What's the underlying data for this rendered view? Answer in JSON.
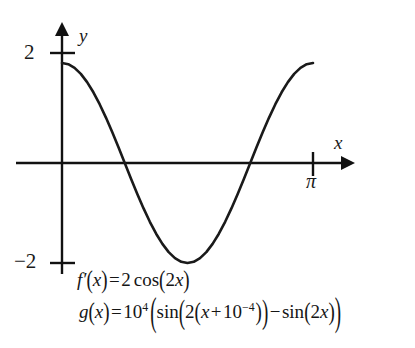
{
  "chart_data": {
    "type": "line",
    "title": "",
    "xlabel": "x",
    "ylabel": "y",
    "xlim": [
      0,
      3.141592653589793
    ],
    "ylim": [
      -2,
      2
    ],
    "grid": false,
    "legend": "none",
    "x_ticks": [
      {
        "value": 3.141592653589793,
        "label": "π"
      }
    ],
    "y_ticks": [
      {
        "value": 2,
        "label": "2"
      },
      {
        "value": -2,
        "label": "−2"
      }
    ],
    "series": [
      {
        "name": "f'(x) = 2cos(2x)",
        "x": [
          0.0,
          0.0785,
          0.1571,
          0.2356,
          0.3142,
          0.3927,
          0.4712,
          0.5498,
          0.6283,
          0.7069,
          0.7854,
          0.8639,
          0.9425,
          1.021,
          1.0996,
          1.1781,
          1.2566,
          1.3352,
          1.4137,
          1.4923,
          1.5708,
          1.6493,
          1.7279,
          1.8064,
          1.885,
          1.9635,
          2.042,
          2.1206,
          2.1991,
          2.2777,
          2.3562,
          2.4347,
          2.5133,
          2.5918,
          2.6704,
          2.7489,
          2.8274,
          2.906,
          2.9845,
          3.0631,
          3.1416
        ],
        "y": [
          2.0,
          1.9754,
          1.9021,
          1.782,
          1.618,
          1.4142,
          1.1756,
          0.908,
          0.618,
          0.3129,
          0.0,
          -0.3129,
          -0.618,
          -0.908,
          -1.1756,
          -1.4142,
          -1.618,
          -1.782,
          -1.9021,
          -1.9754,
          -2.0,
          -1.9754,
          -1.9021,
          -1.782,
          -1.618,
          -1.4142,
          -1.1756,
          -0.908,
          -0.618,
          -0.3129,
          0.0,
          0.3129,
          0.618,
          0.908,
          1.1756,
          1.4142,
          1.618,
          1.782,
          1.9021,
          1.9754,
          2.0
        ]
      }
    ],
    "annotations": [
      "f'(x) = 2cos(2x)",
      "g(x) = 10^4 ( sin(2(x + 10^-4)) - sin(2x) )"
    ]
  },
  "axes": {
    "y_label": "y",
    "x_label": "x",
    "y_tick_top": "2",
    "y_tick_bottom": "−2",
    "x_tick_pi": "π"
  },
  "formulas": {
    "fprime": {
      "fn": "f",
      "prime": "′",
      "open": "(",
      "arg": "x",
      "close": ")",
      "equals": "=",
      "coeff": "2",
      "trig": "cos",
      "inner_open": "(",
      "inner_coeff": "2",
      "inner_var": "x",
      "inner_close": ")"
    },
    "g": {
      "fn": "g",
      "open": "(",
      "arg": "x",
      "close": ")",
      "equals": "=",
      "base": "10",
      "exp": "4",
      "big_open": "(",
      "trig1": "sin",
      "p1_open": "(",
      "two_a": "2",
      "p2_open": "(",
      "var_a": "x",
      "plus": "+",
      "eps_base": "10",
      "eps_exp": "−4",
      "p2_close": ")",
      "p1_close": ")",
      "minus": "−",
      "trig2": "sin",
      "p3_open": "(",
      "two_b": "2",
      "var_b": "x",
      "p3_close": ")",
      "big_close": ")"
    }
  },
  "colors": {
    "curve": "#1a1a1a",
    "axis": "#111111",
    "background": "#ffffff",
    "text": "#151515"
  }
}
